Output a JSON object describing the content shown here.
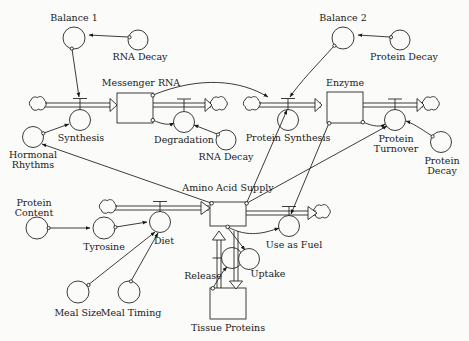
{
  "diagram": {
    "type": "system-dynamics-stock-and-flow",
    "background_color": "#fbfbf9",
    "line_color": "#1a1a1a",
    "stocks": [
      {
        "id": "messenger_rna",
        "label": "Messenger RNA",
        "x": 117,
        "y": 93,
        "w": 36,
        "h": 30
      },
      {
        "id": "enzyme",
        "label": "Enzyme",
        "x": 327,
        "y": 92,
        "w": 36,
        "h": 31
      },
      {
        "id": "amino_acid",
        "label": "Amino Acid Supply",
        "x": 210,
        "y": 202,
        "w": 36,
        "h": 24
      },
      {
        "id": "tissue_proteins",
        "label": "Tissue Proteins",
        "x": 210,
        "y": 288,
        "w": 36,
        "h": 31
      }
    ],
    "flows": [
      {
        "id": "synthesis",
        "label": "Synthesis",
        "cx": 80,
        "cy": 120
      },
      {
        "id": "degradation",
        "label": "Degradation",
        "cx": 184,
        "cy": 122
      },
      {
        "id": "protein_synthesis",
        "label": "Protein Synthesis",
        "cx": 288,
        "cy": 120
      },
      {
        "id": "protein_turnover",
        "label": "Protein Turnover",
        "cx": 395,
        "cy": 120
      },
      {
        "id": "diet",
        "label": "Diet",
        "cx": 160,
        "cy": 222
      },
      {
        "id": "use_as_fuel",
        "label": "Use as Fuel",
        "cx": 289,
        "cy": 226
      },
      {
        "id": "release",
        "label": "Release",
        "cx": 232,
        "cy": 258
      },
      {
        "id": "uptake",
        "label": "Uptake",
        "cx": 249,
        "cy": 259
      }
    ],
    "auxiliaries": [
      {
        "id": "balance_1",
        "label": "Balance 1",
        "cx": 74,
        "cy": 38
      },
      {
        "id": "rna_decay_1",
        "label": "RNA Decay",
        "cx": 138,
        "cy": 40
      },
      {
        "id": "balance_2",
        "label": "Balance 2",
        "cx": 343,
        "cy": 38
      },
      {
        "id": "protein_decay_top",
        "label": "Protein Decay",
        "cx": 400,
        "cy": 40
      },
      {
        "id": "hormonal_rhythms",
        "label": "Hormonal\nRhythms",
        "cx": 33,
        "cy": 137
      },
      {
        "id": "rna_decay_2",
        "label": "RNA Decay",
        "cx": 226,
        "cy": 140
      },
      {
        "id": "protein_decay_rt",
        "label": "Protein\nDecay",
        "cx": 441,
        "cy": 142
      },
      {
        "id": "protein_content",
        "label": "Protein\nContent",
        "cx": 37,
        "cy": 228
      },
      {
        "id": "tyrosine",
        "label": "Tyrosine",
        "cx": 104,
        "cy": 228
      },
      {
        "id": "meal_size",
        "label": "Meal Size",
        "cx": 78,
        "cy": 292
      },
      {
        "id": "meal_timing",
        "label": "Meal Timing",
        "cx": 129,
        "cy": 292
      }
    ],
    "clouds": [
      {
        "id": "cloud_synthesis_src",
        "cx": 38,
        "cy": 105
      },
      {
        "id": "cloud_degradation_sink",
        "cx": 219,
        "cy": 105
      },
      {
        "id": "cloud_protsyn_src",
        "cx": 252,
        "cy": 105
      },
      {
        "id": "cloud_turnover_sink",
        "cx": 431,
        "cy": 105
      },
      {
        "id": "cloud_diet_src",
        "cx": 108,
        "cy": 208
      },
      {
        "id": "cloud_fuel_sink",
        "cx": 322,
        "cy": 213
      }
    ],
    "labels": {
      "balance_1": "Balance 1",
      "rna_decay_1": "RNA Decay",
      "messenger_rna": "Messenger RNA",
      "synthesis": "Synthesis",
      "degradation": "Degradation",
      "rna_decay_2": "RNA Decay",
      "hormonal_rhythms_l1": "Hormonal",
      "hormonal_rhythms_l2": "Rhythms",
      "balance_2": "Balance 2",
      "protein_decay_top": "Protein Decay",
      "enzyme": "Enzyme",
      "protein_synthesis": "Protein Synthesis",
      "protein_turnover_l1": "Protein",
      "protein_turnover_l2": "Turnover",
      "protein_decay_rt_l1": "Protein",
      "protein_decay_rt_l2": "Decay",
      "amino_acid_supply": "Amino Acid Supply",
      "protein_content_l1": "Protein",
      "protein_content_l2": "Content",
      "tyrosine": "Tyrosine",
      "diet": "Diet",
      "use_as_fuel": "Use as Fuel",
      "meal_size": "Meal Size",
      "meal_timing": "Meal Timing",
      "release": "Release",
      "uptake": "Uptake",
      "tissue_proteins": "Tissue Proteins"
    }
  }
}
